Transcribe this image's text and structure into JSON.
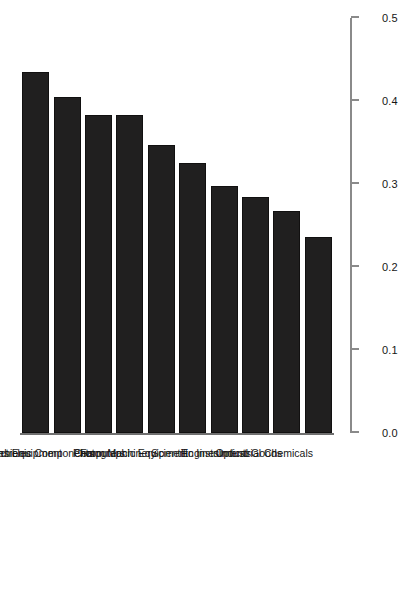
{
  "chart_data": {
    "type": "bar",
    "title": "",
    "subtitle": "",
    "orientation": "vertical-bars-on-rotated-page",
    "categories": [
      "Motor Vehicles",
      "Communications Equipment",
      "Electronic Components",
      "Computers",
      "Farm Machinery",
      "Photographic Equipment",
      "Engines",
      "Scientific Instruments",
      "Optical Goods",
      "Industrial Chemicals"
    ],
    "values": [
      0.435,
      0.405,
      0.383,
      0.383,
      0.347,
      0.325,
      0.298,
      0.284,
      0.267,
      0.236
    ],
    "xlabel": "",
    "ylabel": "Index of Transnational Integration",
    "ylim": [
      0.0,
      0.5
    ],
    "yticks": [
      0.0,
      0.1,
      0.2,
      0.3,
      0.4,
      0.5
    ],
    "ytick_labels": [
      "0.0",
      "0.1",
      "0.2",
      "0.3",
      "0.4",
      "0.5"
    ],
    "grid": false,
    "legend": null,
    "bar_color": "#201f1f"
  },
  "axis": {
    "value_axis_title": "Index of Transnational Integration",
    "tick_labels": [
      "0.0",
      "0.1",
      "0.2",
      "0.3",
      "0.4",
      "0.5"
    ]
  },
  "series": {
    "bars": [
      {
        "label": "Motor Vehicles",
        "value": 0.435
      },
      {
        "label": "Communications Equipment",
        "value": 0.405
      },
      {
        "label": "Electronic Components",
        "value": 0.383
      },
      {
        "label": "Computers",
        "value": 0.383
      },
      {
        "label": "Farm Machinery",
        "value": 0.347
      },
      {
        "label": "Photographic Equipment",
        "value": 0.325
      },
      {
        "label": "Engines",
        "value": 0.298
      },
      {
        "label": "Scientific Instruments",
        "value": 0.284
      },
      {
        "label": "Optical Goods",
        "value": 0.267
      },
      {
        "label": "Industrial Chemicals",
        "value": 0.236
      }
    ]
  },
  "colors": {
    "bar": "#201f1f",
    "axis": "#8a8a8a",
    "text": "#171717",
    "background": "#ffffff"
  }
}
